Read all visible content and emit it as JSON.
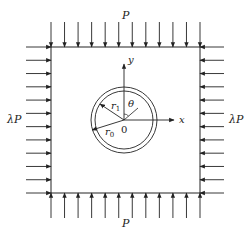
{
  "diagram": {
    "labels": {
      "top_load": "P",
      "bottom_load": "P",
      "left_load": "λP",
      "right_load": "λP",
      "x_axis": "x",
      "y_axis": "y",
      "origin": "0",
      "angle": "θ",
      "inner_radius": "r",
      "inner_radius_sub": "1",
      "outer_radius": "r",
      "outer_radius_sub": "0"
    },
    "plate": {
      "left": 51,
      "top": 47,
      "right": 200,
      "bottom": 193
    },
    "hole": {
      "cx": 124,
      "cy": 120,
      "r_outer": 33,
      "r_inner": 29
    },
    "arrows_per_side": 12,
    "stroke_color": "#222222"
  }
}
